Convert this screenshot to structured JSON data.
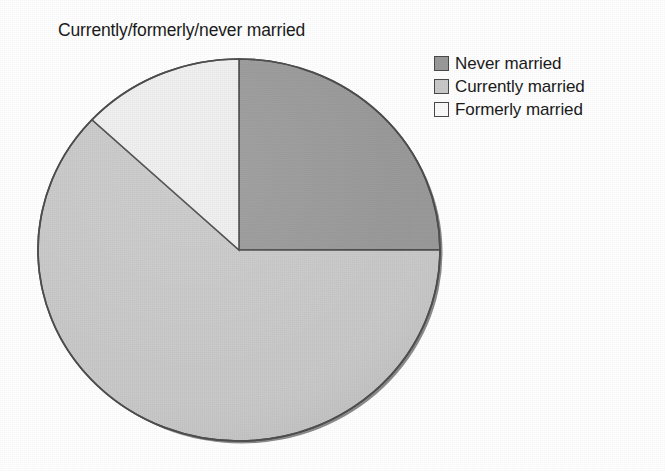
{
  "chart_data": {
    "type": "pie",
    "title": "Currently/formerly/never married",
    "xlabel": "",
    "ylabel": "",
    "legend_position": "top-right",
    "grid": false,
    "start_angle_deg": 0,
    "direction": "clockwise",
    "categories": [
      "Never married",
      "Currently married",
      "Formerly married"
    ],
    "values": [
      25,
      62,
      13
    ],
    "slices": [
      {
        "label": "Never married",
        "value": 25,
        "percent": 25,
        "start_angle_deg": 0,
        "end_angle_deg": 90,
        "color": "#9a9a9a"
      },
      {
        "label": "Currently married",
        "value": 62,
        "percent": 62,
        "start_angle_deg": 90,
        "end_angle_deg": 313,
        "color": "#c9c9c9"
      },
      {
        "label": "Formerly married",
        "value": 13,
        "percent": 13,
        "start_angle_deg": 313,
        "end_angle_deg": 360,
        "color": "#efefef"
      }
    ]
  },
  "title": {
    "text": "Currently/formerly/never married"
  },
  "legend": {
    "items": [
      {
        "label": "Never married",
        "color": "#9a9a9a"
      },
      {
        "label": "Currently married",
        "color": "#c9c9c9"
      },
      {
        "label": "Formerly married",
        "color": "#efefef"
      }
    ]
  },
  "style": {
    "background": "#ffffff",
    "outline": "#4a4a4a",
    "shadow": "#8b8b8b",
    "text": "#1b1b1b"
  }
}
